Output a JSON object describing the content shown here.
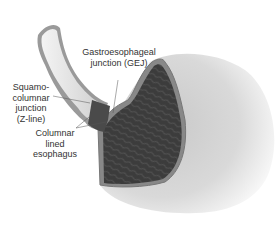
{
  "diagram": {
    "labels": {
      "gej_line1": "Gastroesophageal",
      "gej_line2": "junction (GEJ)",
      "sq_line1": "Squamo-",
      "sq_line2": "columnar",
      "sq_line3": "junction",
      "sq_line4": "(Z-line)",
      "cle_line1": "Columnar",
      "cle_line2": "lined",
      "cle_line3": "esophagus"
    },
    "credit": "artist signature",
    "colors": {
      "stomach_outer": "#e4e4e4",
      "mucosa": "#3a3a3a",
      "esophagus_lumen": "#e8e8e8",
      "wall": "#9a9a9a",
      "text": "#333333"
    }
  }
}
